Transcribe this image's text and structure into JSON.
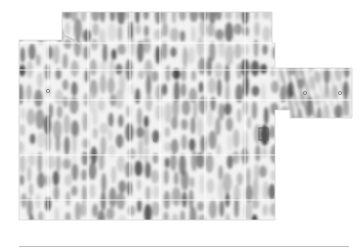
{
  "figure": {
    "kind": "wave-interference heatmap over floor plan",
    "palette": {
      "background": "#ffffff",
      "dark": "#3c3c3c",
      "mid": "#9a9a9a",
      "light": "#e6e6e6",
      "grid": "#d0d0d0",
      "rule": "#bdbdbd"
    },
    "regions": [
      {
        "name": "main-floor",
        "x": 19,
        "y": 40,
        "w": 256,
        "h": 180
      },
      {
        "name": "top-wing",
        "x": 62,
        "y": 12,
        "w": 210,
        "h": 30
      },
      {
        "name": "right-wing",
        "x": 275,
        "y": 68,
        "w": 77,
        "h": 50
      }
    ],
    "markers": [
      {
        "name": "highlight-box",
        "x": 259,
        "y": 128,
        "w": 9,
        "h": 12
      },
      {
        "name": "ap-marker-1",
        "x": 305,
        "y": 93
      },
      {
        "name": "ap-marker-2",
        "x": 340,
        "y": 93
      },
      {
        "name": "ap-marker-3",
        "x": 48,
        "y": 91
      },
      {
        "name": "ap-marker-4",
        "x": 155,
        "y": 140
      }
    ]
  }
}
